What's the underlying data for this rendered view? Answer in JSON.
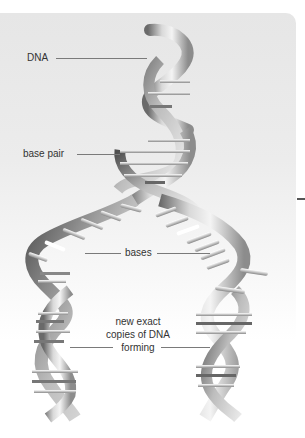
{
  "diagram": {
    "labels": {
      "dna": "DNA",
      "base_pair": "base pair",
      "bases": "bases",
      "new_copies_line1": "new exact",
      "new_copies_line2": "copies of DNA",
      "new_copies_line3": "forming"
    },
    "colors": {
      "panel_background": "#e8e8e8",
      "strand_light": "#f2f2f2",
      "strand_mid": "#b8b8b8",
      "strand_dark": "#5a5a5a",
      "leader_line": "#7a7a7a",
      "label_text": "#333333"
    }
  }
}
